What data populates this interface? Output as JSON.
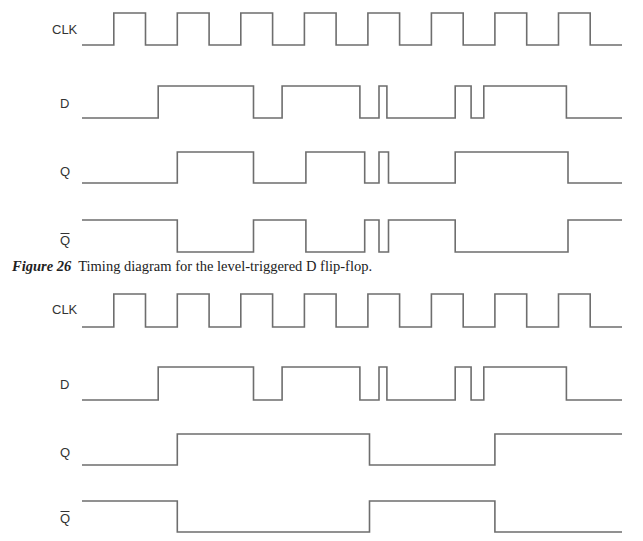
{
  "caption": {
    "figure_label": "Figure 26",
    "text": "Timing diagram for the level-triggered D flip-flop."
  },
  "time_span": [
    0,
    17
  ],
  "diagrams": [
    {
      "name": "level-triggered",
      "signals": [
        {
          "label": "CLK",
          "initial": 0,
          "edges": [
            1,
            2,
            3,
            4,
            5,
            6,
            7,
            8,
            9,
            10,
            11,
            12,
            13,
            14,
            15,
            16
          ]
        },
        {
          "label": "D",
          "initial": 0,
          "edges": [
            2.4,
            5.4,
            6.3,
            8.75,
            9.35,
            9.6,
            11.75,
            12.25,
            12.65,
            15.25
          ]
        },
        {
          "label": "Q",
          "initial": 0,
          "edges": [
            3,
            5.4,
            7.05,
            8.9,
            9.35,
            9.65,
            11.75,
            15.3
          ]
        },
        {
          "label": "Q̄",
          "initial": 1,
          "edges": [
            3,
            5.4,
            7.05,
            8.9,
            9.35,
            9.65,
            11.75,
            15.3
          ]
        }
      ]
    },
    {
      "name": "edge-triggered",
      "signals": [
        {
          "label": "CLK",
          "initial": 0,
          "edges": [
            1,
            2,
            3,
            4,
            5,
            6,
            7,
            8,
            9,
            10,
            11,
            12,
            13,
            14,
            15,
            16
          ]
        },
        {
          "label": "D",
          "initial": 0,
          "edges": [
            2.4,
            5.4,
            6.3,
            8.75,
            9.35,
            9.6,
            11.75,
            12.25,
            12.65,
            15.25
          ]
        },
        {
          "label": "Q",
          "initial": 0,
          "edges": [
            3,
            9.05,
            13
          ]
        },
        {
          "label": "Q̄",
          "initial": 1,
          "edges": [
            3,
            9.05,
            13
          ]
        }
      ]
    }
  ]
}
